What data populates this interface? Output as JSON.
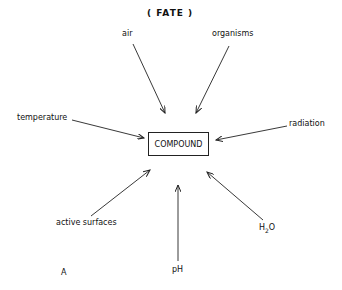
{
  "diagram": {
    "title": "( FATE )",
    "center": "COMPOUND",
    "panel_label": "A",
    "factors": {
      "air": "air",
      "organisms": "organisms",
      "temperature": "temperature",
      "radiation": "radiation",
      "active_surfaces": "active surfaces",
      "ph": "pH",
      "h2o_main": "H",
      "h2o_sub": "2",
      "h2o_tail": "O"
    }
  }
}
